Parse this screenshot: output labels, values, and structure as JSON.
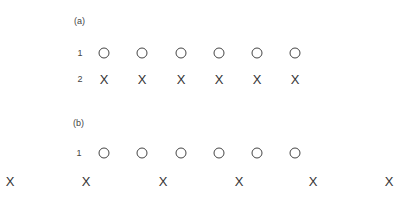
{
  "panels": [
    {
      "label": "(a)",
      "label_pos": {
        "x": 74,
        "y": 16
      },
      "rows": [
        {
          "row_label": "1",
          "label_x": 80,
          "y": 53,
          "symbol": "circle",
          "positions": [
            104,
            142,
            181,
            219,
            257,
            295
          ]
        },
        {
          "row_label": "2",
          "label_x": 80,
          "y": 79,
          "symbol": "cross",
          "glyph": "X",
          "positions": [
            104,
            142,
            181,
            219,
            257,
            295
          ]
        }
      ]
    },
    {
      "label": "(b)",
      "label_pos": {
        "x": 73,
        "y": 118
      },
      "rows": [
        {
          "row_label": "1",
          "label_x": 79,
          "y": 153,
          "symbol": "circle",
          "positions": [
            104,
            142,
            181,
            219,
            257,
            295
          ]
        },
        {
          "row_label": "",
          "label_x": 0,
          "y": 181,
          "symbol": "cross",
          "glyph": "X",
          "positions": [
            10,
            86,
            163,
            239,
            313,
            389
          ]
        }
      ]
    }
  ]
}
